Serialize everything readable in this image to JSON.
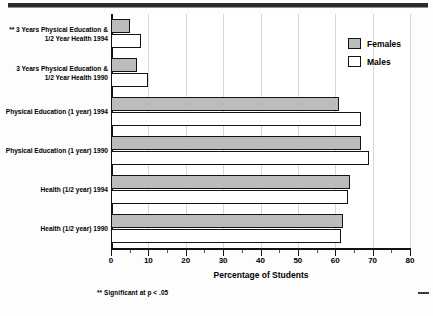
{
  "chart_data": {
    "type": "bar",
    "orientation": "horizontal",
    "title": "",
    "xlabel": "Percentage of Students",
    "ylabel": "",
    "xlim": [
      0,
      80
    ],
    "xticks": [
      0,
      10,
      20,
      30,
      40,
      50,
      60,
      70,
      80
    ],
    "minor_tick_step": 5,
    "grid": "vertical",
    "legend_position": "top-right",
    "categories": [
      "** 3 Years Physical Education &\n1/2 Year Health 1994",
      "3 Years Physical Education &\n1/2 Year Health 1990",
      "Physical Education (1 year) 1994",
      "Physical Education (1 year) 1990",
      "Health (1/2 year) 1994",
      "Health (1/2 year) 1990"
    ],
    "series": [
      {
        "name": "Females",
        "color": "#bcbcbc",
        "values": [
          5,
          7,
          61,
          67,
          64,
          62
        ]
      },
      {
        "name": "Males",
        "color": "#ffffff",
        "values": [
          8,
          10,
          67,
          69,
          63.5,
          61.5
        ]
      }
    ],
    "annotations": [
      "** Significant at p < .05"
    ]
  },
  "axis": {
    "title": "Percentage of Students",
    "tick_labels": [
      "0",
      "10",
      "20",
      "30",
      "40",
      "50",
      "60",
      "70",
      "80"
    ]
  },
  "legend": {
    "items": [
      {
        "label": "Females",
        "swatch": "gray-filled-square"
      },
      {
        "label": "Males",
        "swatch": "white-filled-square"
      }
    ]
  },
  "footnote": {
    "text": "** Significant at p < .05"
  },
  "colors": {
    "females_fill": "#bcbcbc",
    "males_fill": "#ffffff",
    "outline": "#131313",
    "gridline": "#d8d8d8",
    "axis": "#141414"
  }
}
